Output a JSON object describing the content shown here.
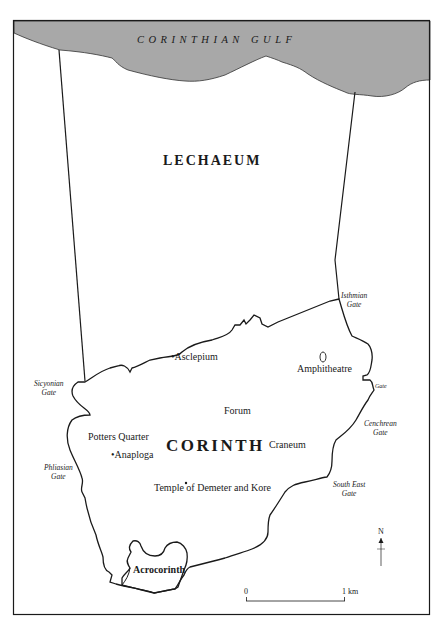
{
  "map": {
    "sea": {
      "label": "CORINTHIAN GULF",
      "fill": "#a8a8a8"
    },
    "regions": [
      {
        "id": "lechaeum",
        "label": "LECHAEUM"
      },
      {
        "id": "corinth",
        "label": "CORINTH"
      },
      {
        "id": "acrocorinth",
        "label": "Acrocorinth"
      }
    ],
    "gates": [
      {
        "id": "isthmian",
        "line1": "Isthmian",
        "line2": "Gate"
      },
      {
        "id": "sicyonian",
        "line1": "Sicyonian",
        "line2": "Gate"
      },
      {
        "id": "gate",
        "line1": "Gate",
        "line2": ""
      },
      {
        "id": "cenchrean",
        "line1": "Cenchrean",
        "line2": "Gate"
      },
      {
        "id": "phliasian",
        "line1": "Phliasian",
        "line2": "Gate"
      },
      {
        "id": "south-east",
        "line1": "South East",
        "line2": "Gate"
      }
    ],
    "sites": [
      {
        "id": "asclepium",
        "label": "•Asclepium"
      },
      {
        "id": "amphitheatre",
        "label": "Amphitheatre"
      },
      {
        "id": "forum",
        "label": "Forum"
      },
      {
        "id": "potters-quarter",
        "label": "Potters Quarter"
      },
      {
        "id": "anaploga",
        "label": "•Anaploga"
      },
      {
        "id": "craneum",
        "label": "Craneum"
      },
      {
        "id": "temple",
        "label": "Temple of Demeter and Kore"
      }
    ],
    "scale": {
      "start": "0",
      "end": "1 km"
    },
    "north": {
      "label": "N"
    }
  }
}
